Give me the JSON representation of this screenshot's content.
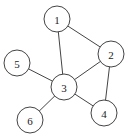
{
  "graph": {
    "radius": 13,
    "colors": {
      "stroke": "#444444",
      "fill": "#ffffff",
      "text": "#222222"
    },
    "nodes": [
      {
        "id": "1",
        "label": "1",
        "x": 57,
        "y": 19
      },
      {
        "id": "2",
        "label": "2",
        "x": 111,
        "y": 54
      },
      {
        "id": "3",
        "label": "3",
        "x": 64,
        "y": 87
      },
      {
        "id": "4",
        "label": "4",
        "x": 104,
        "y": 113
      },
      {
        "id": "5",
        "label": "5",
        "x": 17,
        "y": 63
      },
      {
        "id": "6",
        "label": "6",
        "x": 30,
        "y": 120
      }
    ],
    "edges": [
      {
        "from": "1",
        "to": "2"
      },
      {
        "from": "1",
        "to": "3"
      },
      {
        "from": "2",
        "to": "3"
      },
      {
        "from": "2",
        "to": "4"
      },
      {
        "from": "3",
        "to": "4"
      },
      {
        "from": "3",
        "to": "5"
      },
      {
        "from": "3",
        "to": "6"
      }
    ]
  }
}
